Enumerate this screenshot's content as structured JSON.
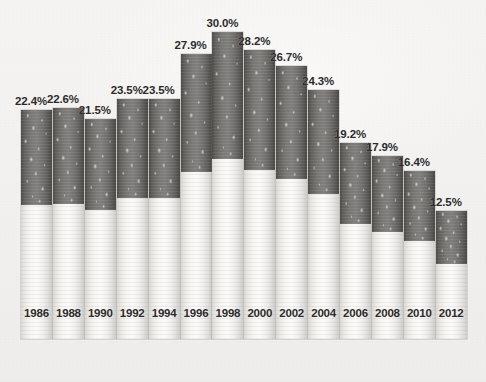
{
  "chart_data": {
    "type": "bar",
    "title": "",
    "subtitle": "",
    "xlabel": "",
    "ylabel": "",
    "ylim": [
      0,
      30.0
    ],
    "grid": false,
    "legend": null,
    "bar_style": "cigarette-image-fill",
    "categories": [
      "1986",
      "1988",
      "1990",
      "1992",
      "1994",
      "1996",
      "1998",
      "2000",
      "2002",
      "2004",
      "2006",
      "2008",
      "2010",
      "2012"
    ],
    "values": [
      22.4,
      22.6,
      21.5,
      23.5,
      23.5,
      27.9,
      30.0,
      28.2,
      26.7,
      24.3,
      19.2,
      17.9,
      16.4,
      12.5
    ],
    "data_labels": [
      "22.4%",
      "22.6%",
      "21.5%",
      "23.5%",
      "23.5%",
      "27.9%",
      "30.0%",
      "28.2%",
      "26.7%",
      "24.3%",
      "19.2%",
      "17.9%",
      "16.4%",
      "12.5%"
    ],
    "series": [
      {
        "name": "",
        "values": [
          22.4,
          22.6,
          21.5,
          23.5,
          23.5,
          27.9,
          30.0,
          28.2,
          26.7,
          24.3,
          19.2,
          17.9,
          16.4,
          12.5
        ]
      }
    ],
    "max_value": 30.0,
    "max_category": "1998",
    "min_value": 12.5,
    "min_category": "2012"
  },
  "ghost_text": "",
  "colors": {
    "background": "#f2f1ef",
    "filter_dark": "#7b7976",
    "paper_light": "#f8f7f5",
    "label_text": "#2b2a29"
  }
}
